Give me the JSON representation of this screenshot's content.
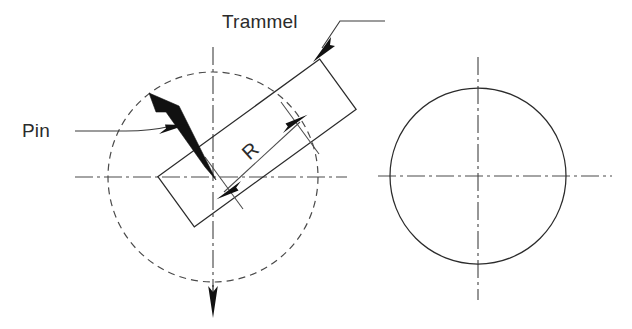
{
  "figure": {
    "type": "engineering-diagram",
    "title_visible": false,
    "background_color": "#ffffff",
    "line_color": "#2b2b2b",
    "accent_color": "#111111",
    "width": 632,
    "height": 329
  },
  "labels": {
    "trammel": "Trammel",
    "pin": "Pin",
    "radius": "R"
  },
  "geometry": {
    "left_view": {
      "center": {
        "x": 213,
        "y": 177
      },
      "construction_circle": {
        "style": "dashed",
        "radius": 105,
        "name": "swept-path-circle"
      },
      "horizontal_centerline": {
        "x1": 75,
        "y1": 177,
        "x2": 345,
        "y2": 177
      },
      "vertical_centerline": {
        "x1": 213,
        "y1": 47,
        "x2": 213,
        "y2": 288
      },
      "vertical_arrow": {
        "tip_x": 213,
        "tip_y": 315,
        "direction": "down"
      },
      "trammel_rect": {
        "angle_deg": -36,
        "length": 200,
        "width": 62,
        "center": {
          "x": 257,
          "y": 143
        }
      },
      "pin": {
        "head": {
          "x": 158,
          "y": 100
        },
        "tip": {
          "x": 213,
          "y": 177
        },
        "style": "solid-black-nail"
      },
      "dimension_R": {
        "from": {
          "x": 222,
          "y": 190
        },
        "to": {
          "x": 300,
          "y": 121
        },
        "arrowheads": "both"
      }
    },
    "right_view": {
      "center": {
        "x": 478,
        "y": 176
      },
      "circle": {
        "style": "solid",
        "radius": 88,
        "name": "generated-circle"
      },
      "horizontal_centerline": {
        "x1": 378,
        "y1": 176,
        "x2": 610,
        "y2": 176
      },
      "vertical_centerline": {
        "x1": 478,
        "y1": 58,
        "x2": 478,
        "y2": 300
      }
    }
  },
  "leaders": {
    "trammel_leader": {
      "from": {
        "x": 383,
        "y": 22
      },
      "bend": {
        "x": 337,
        "y": 22
      },
      "arrow_tip": {
        "x": 316,
        "y": 55
      }
    },
    "pin_leader": {
      "from": {
        "x": 75,
        "y": 131
      },
      "bend": {
        "x": 128,
        "y": 131
      },
      "arrow_tip": {
        "x": 182,
        "y": 127
      }
    }
  }
}
